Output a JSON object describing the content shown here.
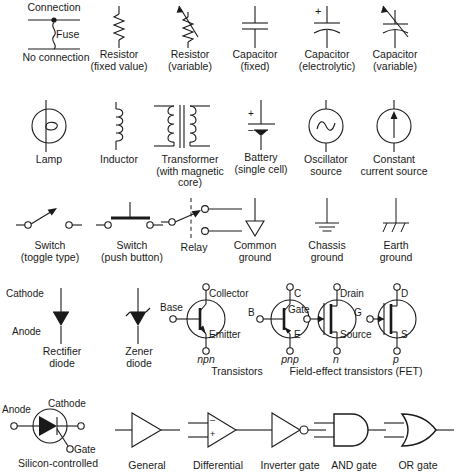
{
  "sheet": {
    "title": "Electronic circuit schematic symbols chart",
    "stroke_color": "#1a1a1a",
    "fill_color": "#1a1a1a",
    "background": "#ffffff",
    "columns": 6,
    "rows": 5
  },
  "rows": [
    {
      "id": "row-passive",
      "items": [
        {
          "id": "connection-fuse",
          "symbol": "connection-fuse-noconnection",
          "label": "",
          "pins": [
            {
              "text": "Connection",
              "role": "top-label"
            },
            {
              "text": "Fuse",
              "role": "middle-label"
            },
            {
              "text": "No connection",
              "role": "bottom-label"
            }
          ]
        },
        {
          "id": "resistor-fixed",
          "symbol": "resistor-fixed",
          "label": "Resistor\n(fixed value)",
          "pins": []
        },
        {
          "id": "resistor-variable",
          "symbol": "resistor-variable",
          "label": "Resistor\n(variable)",
          "pins": []
        },
        {
          "id": "capacitor-fixed",
          "symbol": "capacitor-fixed",
          "label": "Capacitor\n(fixed)",
          "pins": []
        },
        {
          "id": "capacitor-electrolytic",
          "symbol": "capacitor-electrolytic",
          "label": "Capacitor\n(electrolytic)",
          "pins": [
            {
              "text": "+",
              "role": "polarity"
            }
          ]
        },
        {
          "id": "capacitor-variable",
          "symbol": "capacitor-variable",
          "label": "Capacitor\n(variable)",
          "pins": []
        }
      ]
    },
    {
      "id": "row-sources",
      "items": [
        {
          "id": "lamp",
          "symbol": "lamp",
          "label": "Lamp",
          "pins": []
        },
        {
          "id": "inductor",
          "symbol": "inductor",
          "label": "Inductor",
          "pins": []
        },
        {
          "id": "transformer",
          "symbol": "transformer",
          "label": "Transformer\n(with magnetic\ncore)",
          "pins": []
        },
        {
          "id": "battery",
          "symbol": "battery",
          "label": "Battery\n(single cell)",
          "pins": [
            {
              "text": "+",
              "role": "polarity"
            },
            {
              "text": "–",
              "role": "polarity"
            }
          ]
        },
        {
          "id": "oscillator-source",
          "symbol": "oscillator-source",
          "label": "Oscillator\nsource",
          "pins": []
        },
        {
          "id": "constant-current-source",
          "symbol": "constant-current-source",
          "label": "Constant\ncurrent source",
          "pins": []
        }
      ]
    },
    {
      "id": "row-switches-grounds",
      "items": [
        {
          "id": "switch-toggle",
          "symbol": "switch-toggle",
          "label": "Switch\n(toggle type)",
          "pins": []
        },
        {
          "id": "switch-pushbutton",
          "symbol": "switch-pushbutton",
          "label": "Switch\n(push button)",
          "pins": []
        },
        {
          "id": "relay",
          "symbol": "relay",
          "label": "Relay",
          "pins": []
        },
        {
          "id": "common-ground",
          "symbol": "common-ground",
          "label": "Common\nground",
          "pins": []
        },
        {
          "id": "chassis-ground",
          "symbol": "chassis-ground",
          "label": "Chassis\nground",
          "pins": []
        },
        {
          "id": "earth-ground",
          "symbol": "earth-ground",
          "label": "Earth\nground",
          "pins": []
        }
      ]
    },
    {
      "id": "row-semiconductors",
      "items": [
        {
          "id": "rectifier-diode",
          "symbol": "rectifier-diode",
          "label": "Rectifier\ndiode",
          "pins": [
            {
              "text": "Cathode",
              "role": "terminal"
            },
            {
              "text": "Anode",
              "role": "terminal"
            }
          ]
        },
        {
          "id": "zener-diode",
          "symbol": "zener-diode",
          "label": "Zener\ndiode",
          "pins": []
        },
        {
          "id": "transistor-npn",
          "symbol": "transistor-npn",
          "label": "npn",
          "pins": [
            {
              "text": "Base",
              "role": "terminal"
            },
            {
              "text": "Collector",
              "role": "terminal"
            },
            {
              "text": "Emitter",
              "role": "terminal"
            }
          ]
        },
        {
          "id": "transistor-pnp",
          "symbol": "transistor-pnp",
          "label": "pnp",
          "pins": [
            {
              "text": "B",
              "role": "terminal"
            },
            {
              "text": "C",
              "role": "terminal"
            },
            {
              "text": "E",
              "role": "terminal"
            }
          ]
        },
        {
          "id": "fet-n",
          "symbol": "fet-n-channel",
          "label": "n",
          "pins": [
            {
              "text": "Gate",
              "role": "terminal"
            },
            {
              "text": "Drain",
              "role": "terminal"
            },
            {
              "text": "Source",
              "role": "terminal"
            }
          ]
        },
        {
          "id": "fet-p",
          "symbol": "fet-p-channel",
          "label": "p",
          "pins": [
            {
              "text": "G",
              "role": "terminal"
            },
            {
              "text": "D",
              "role": "terminal"
            },
            {
              "text": "S",
              "role": "terminal"
            }
          ]
        }
      ]
    },
    {
      "id": "row-gates",
      "items": [
        {
          "id": "scr",
          "symbol": "silicon-controlled-rectifier",
          "label": "Silicon-controlled",
          "pins": [
            {
              "text": "Anode",
              "role": "terminal"
            },
            {
              "text": "Cathode",
              "role": "terminal"
            },
            {
              "text": "Gate",
              "role": "terminal"
            }
          ]
        },
        {
          "id": "amp-general",
          "symbol": "amplifier-general",
          "label": "General",
          "pins": []
        },
        {
          "id": "amp-differential",
          "symbol": "amplifier-differential",
          "label": "Differential",
          "pins": [
            {
              "text": "–",
              "role": "input"
            },
            {
              "text": "+",
              "role": "input"
            }
          ]
        },
        {
          "id": "inverter-gate",
          "symbol": "inverter-gate",
          "label": "Inverter gate",
          "pins": []
        },
        {
          "id": "and-gate",
          "symbol": "and-gate",
          "label": "AND gate",
          "pins": []
        },
        {
          "id": "or-gate",
          "symbol": "or-gate",
          "label": "OR gate",
          "pins": []
        }
      ]
    }
  ],
  "group_labels": [
    {
      "id": "group-transistors",
      "text": "Transistors"
    },
    {
      "id": "group-fets",
      "text": "Field-effect transistors (FET)"
    }
  ],
  "italic_labels": [
    "npn",
    "pnp",
    "n",
    "p",
    "AND",
    "OR"
  ]
}
